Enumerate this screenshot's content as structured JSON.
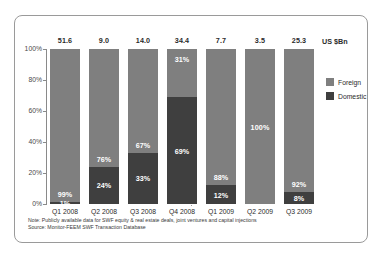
{
  "unit_label": "US $Bn",
  "colors": {
    "foreign": "#7f7f7f",
    "domestic": "#3f3f3f",
    "border": "#9a9a9a",
    "text": "#2b2b2b"
  },
  "legend": {
    "items": [
      {
        "label": "Foreign",
        "color": "#7f7f7f"
      },
      {
        "label": "Domestic",
        "color": "#3f3f3f"
      }
    ]
  },
  "footnotes": [
    "Note: Publicly available data for SWF equity & real estate deals, joint ventures and capital injections",
    "Source: Monitor-FEEM SWF Transaction Database"
  ],
  "chart_data": {
    "type": "bar",
    "subtype": "stacked-100-percent",
    "title": "",
    "xlabel": "",
    "ylabel": "",
    "ylim": [
      0,
      100
    ],
    "ytick_labels": [
      "0%",
      "20%",
      "40%",
      "60%",
      "80%",
      "100%"
    ],
    "ytick_values": [
      0,
      20,
      40,
      60,
      80,
      100
    ],
    "grid": false,
    "legend_position": "right",
    "unit_note": "US $Bn",
    "categories": [
      "Q1 2008",
      "Q2 2008",
      "Q3 2008",
      "Q4 2008",
      "Q1 2009",
      "Q2 2009",
      "Q3 2009"
    ],
    "totals": [
      "51.6",
      "9.0",
      "14.0",
      "34.4",
      "7.7",
      "3.5",
      "25.3"
    ],
    "series": [
      {
        "name": "Foreign",
        "color": "#7f7f7f",
        "values": [
          99,
          76,
          67,
          31,
          88,
          100,
          92
        ],
        "labels": [
          "99%",
          "76%",
          "67%",
          "31%",
          "88%",
          "100%",
          "92%"
        ]
      },
      {
        "name": "Domestic",
        "color": "#3f3f3f",
        "values": [
          1,
          24,
          33,
          69,
          12,
          0,
          8
        ],
        "labels": [
          "1%",
          "24%",
          "33%",
          "69%",
          "12%",
          "",
          "8%"
        ]
      }
    ],
    "annotations": [
      "dotted vertical divider between Q4 2008 and Q1 2009"
    ]
  }
}
